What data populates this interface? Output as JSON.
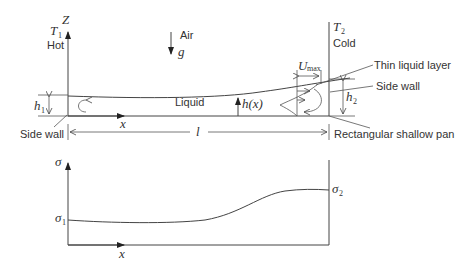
{
  "top_panel": {
    "z_axis_label": "Z",
    "left_temp_label": "T",
    "left_temp_sub": "1",
    "left_temp_desc": "Hot",
    "right_temp_label": "T",
    "right_temp_sub": "2",
    "right_temp_desc": "Cold",
    "air_label": "Air",
    "gravity_label": "g",
    "liquid_label": "Liquid",
    "height_fn_label": "h(x)",
    "x_axis_label": "x",
    "h1_label": "h",
    "h1_sub": "1",
    "h2_label": "h",
    "h2_sub": "2",
    "length_label": "l",
    "umax_label": "U",
    "umax_sub": "max",
    "callouts": {
      "left_side_wall": "Side wall",
      "thin_liquid_layer": "Thin liquid layer",
      "right_side_wall": "Side wall",
      "pan": "Rectangular shallow pan"
    }
  },
  "bottom_panel": {
    "y_axis_label": "σ",
    "x_axis_label": "x",
    "sigma1_label": "σ",
    "sigma1_sub": "1",
    "sigma2_label": "σ",
    "sigma2_sub": "2"
  },
  "colors": {
    "line": "#444444",
    "text": "#333333",
    "background": "#ffffff"
  }
}
